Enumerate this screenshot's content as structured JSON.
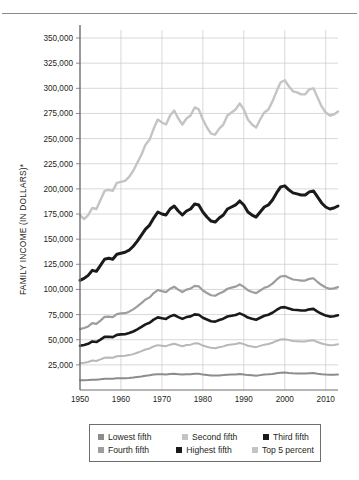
{
  "figure": {
    "has_top_rule": true
  },
  "chart_data": {
    "type": "line",
    "title": "",
    "subtitle": "",
    "xlabel": "",
    "ylabel": "FAMILY INCOME (IN DOLLARS)*",
    "xlim": [
      1950,
      2013
    ],
    "ylim": [
      0,
      358000
    ],
    "grid": true,
    "legend_position": "bottom",
    "y_ticks": [
      25000,
      50000,
      75000,
      100000,
      125000,
      150000,
      175000,
      200000,
      225000,
      250000,
      275000,
      300000,
      325000,
      350000
    ],
    "y_tick_labels": [
      "25,000",
      "50,000",
      "75,000",
      "100,000",
      "125,000",
      "150,000",
      "175,000",
      "200,000",
      "225,000",
      "250,000",
      "275,000",
      "300,000",
      "325,000",
      "350,000"
    ],
    "x_ticks": [
      1950,
      1960,
      1970,
      1980,
      1990,
      2000,
      2010
    ],
    "x_tick_labels": [
      "1950",
      "1960",
      "1970",
      "1980",
      "1990",
      "2000",
      "2010"
    ],
    "x": [
      1950,
      1951,
      1952,
      1953,
      1954,
      1955,
      1956,
      1957,
      1958,
      1959,
      1960,
      1961,
      1962,
      1963,
      1964,
      1965,
      1966,
      1967,
      1968,
      1969,
      1970,
      1971,
      1972,
      1973,
      1974,
      1975,
      1976,
      1977,
      1978,
      1979,
      1980,
      1981,
      1982,
      1983,
      1984,
      1985,
      1986,
      1987,
      1988,
      1989,
      1990,
      1991,
      1992,
      1993,
      1994,
      1995,
      1996,
      1997,
      1998,
      1999,
      2000,
      2001,
      2002,
      2003,
      2004,
      2005,
      2006,
      2007,
      2008,
      2009,
      2010,
      2011,
      2012,
      2013
    ],
    "series": [
      {
        "name": "Lowest fifth",
        "color": "#8c8c8c",
        "width": 2.0,
        "values": [
          9600,
          9700,
          9900,
          10300,
          10100,
          10600,
          11300,
          11300,
          11200,
          11600,
          11800,
          11800,
          12000,
          12400,
          12900,
          13400,
          14100,
          14600,
          15300,
          15700,
          15600,
          15400,
          15900,
          16100,
          15700,
          15300,
          15600,
          15700,
          16200,
          16100,
          15300,
          14900,
          14400,
          14300,
          14500,
          14800,
          15200,
          15400,
          15500,
          15800,
          15400,
          14800,
          14600,
          14200,
          14800,
          15400,
          15600,
          16000,
          16700,
          17200,
          17300,
          16900,
          16600,
          16500,
          16400,
          16400,
          16700,
          16800,
          16200,
          15700,
          15300,
          15100,
          15200,
          15400
        ]
      },
      {
        "name": "Second fifth",
        "color": "#b8b8b8",
        "width": 2.0,
        "values": [
          26700,
          27100,
          27800,
          29300,
          28900,
          30400,
          32100,
          32300,
          32100,
          33500,
          33900,
          34000,
          34700,
          35700,
          37100,
          38600,
          40300,
          41300,
          43300,
          44600,
          44100,
          43600,
          45100,
          46000,
          44700,
          43600,
          44700,
          45100,
          46400,
          46200,
          44200,
          43000,
          41900,
          41600,
          42600,
          43400,
          44800,
          45300,
          45700,
          46700,
          45600,
          44000,
          43300,
          42600,
          43900,
          45100,
          45800,
          47000,
          48800,
          50200,
          50500,
          49600,
          48800,
          48600,
          48300,
          48300,
          49100,
          49400,
          47700,
          46300,
          45200,
          44600,
          44800,
          45400
        ]
      },
      {
        "name": "Third fifth",
        "color": "#1a1a1a",
        "width": 2.6,
        "values": [
          44000,
          44800,
          45900,
          48300,
          47700,
          50100,
          52800,
          53000,
          52600,
          54800,
          55300,
          55500,
          56600,
          58200,
          60300,
          62700,
          65300,
          66900,
          70000,
          72200,
          71400,
          70700,
          73200,
          74600,
          72500,
          70700,
          72500,
          73200,
          75200,
          74900,
          71900,
          70100,
          68400,
          68000,
          69600,
          70900,
          73100,
          73900,
          74600,
          76200,
          74500,
          72000,
          70800,
          69900,
          71800,
          73800,
          74800,
          76800,
          79600,
          82000,
          82400,
          81100,
          79800,
          79500,
          79000,
          79000,
          80200,
          80700,
          78000,
          75800,
          74000,
          73000,
          73400,
          74300
        ]
      },
      {
        "name": "Fourth fifth",
        "color": "#9d9d9d",
        "width": 2.2,
        "values": [
          60500,
          61600,
          63200,
          66500,
          65700,
          69000,
          72700,
          73000,
          72400,
          75400,
          76200,
          76400,
          77900,
          80200,
          83100,
          86400,
          90000,
          92100,
          96400,
          99400,
          98300,
          97400,
          100700,
          102700,
          99800,
          97400,
          99800,
          100800,
          103500,
          103100,
          99000,
          96500,
          94200,
          93700,
          95900,
          97700,
          100700,
          101800,
          102800,
          105000,
          102600,
          99200,
          97500,
          96300,
          98900,
          101600,
          103000,
          105800,
          109700,
          112900,
          113500,
          111600,
          109900,
          109400,
          108800,
          108800,
          110500,
          111100,
          107400,
          104400,
          101900,
          100600,
          101100,
          102300
        ]
      },
      {
        "name": "Highest fifth",
        "color": "#1a1a1a",
        "width": 3.0,
        "values": [
          109000,
          111000,
          114000,
          119000,
          118000,
          124000,
          130000,
          131000,
          130000,
          135000,
          136000,
          137000,
          139000,
          143000,
          148000,
          154000,
          160000,
          164000,
          171000,
          177000,
          175000,
          174000,
          180000,
          183000,
          178000,
          174000,
          178000,
          180000,
          185000,
          184000,
          177000,
          172000,
          168000,
          167000,
          171000,
          174000,
          180000,
          182000,
          184000,
          188000,
          184000,
          177000,
          174000,
          172000,
          177000,
          182000,
          184000,
          189000,
          196000,
          202000,
          203000,
          199000,
          196000,
          195000,
          194000,
          194000,
          197000,
          198000,
          192000,
          186000,
          182000,
          180000,
          181000,
          183000
        ]
      },
      {
        "name": "Top 5 percent",
        "color": "#c4c4c4",
        "width": 2.4,
        "values": [
          174000,
          170000,
          174000,
          181000,
          180000,
          189000,
          198000,
          199000,
          198000,
          206000,
          207000,
          208000,
          212000,
          218000,
          226000,
          234000,
          244000,
          249000,
          260000,
          269000,
          266000,
          264000,
          273000,
          278000,
          270000,
          264000,
          270000,
          273000,
          281000,
          279000,
          269000,
          261000,
          255000,
          254000,
          260000,
          264000,
          273000,
          276000,
          279000,
          285000,
          279000,
          269000,
          264000,
          261000,
          269000,
          276000,
          279000,
          287000,
          297000,
          306000,
          308000,
          302000,
          297000,
          296000,
          294000,
          294000,
          299000,
          300000,
          291000,
          282000,
          276000,
          273000,
          274000,
          277000
        ]
      }
    ]
  },
  "legend": {
    "rows": [
      [
        {
          "label": "Lowest fifth",
          "color": "#8c8c8c"
        },
        {
          "label": "Second fifth",
          "color": "#c4c4c4"
        },
        {
          "label": "Third fifth",
          "color": "#1a1a1a"
        }
      ],
      [
        {
          "label": "Fourth fifth",
          "color": "#9d9d9d"
        },
        {
          "label": "Highest fifth",
          "color": "#1a1a1a"
        },
        {
          "label": "Top 5 percent",
          "color": "#c4c4c4"
        }
      ]
    ]
  }
}
